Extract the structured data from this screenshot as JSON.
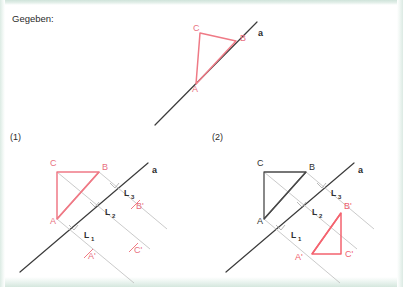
{
  "page": {
    "heading": "Gegeben:",
    "background_color": "#ffffff",
    "edge_color": "#d5e7de",
    "red_accent": "#ef7a86",
    "black_accent": "#3b3b3b",
    "helper_color": "#bdbdbd"
  },
  "given": {
    "axis_label": "a",
    "vertices": [
      {
        "name": "C",
        "x": 200,
        "y": 33
      },
      {
        "name": "B",
        "x": 236,
        "y": 41
      },
      {
        "name": "A",
        "x": 196,
        "y": 84
      }
    ],
    "vertex_labels": [
      {
        "text": "C",
        "x": 193,
        "y": 31
      },
      {
        "text": "B",
        "x": 240,
        "y": 41
      },
      {
        "text": "A",
        "x": 192,
        "y": 92
      }
    ],
    "axis_label_pos": {
      "x": 258,
      "y": 36
    }
  },
  "steps": [
    {
      "id": "step-1",
      "label": "(1)",
      "label_pos": {
        "x": 10,
        "y": 140
      },
      "axis_label": "a",
      "axis_label_pos": {
        "x": 152,
        "y": 173
      },
      "triangle_color": "#ef7a86",
      "vertex_labels": [
        {
          "text": "C",
          "x": 50,
          "y": 166
        },
        {
          "text": "B",
          "x": 102,
          "y": 170
        },
        {
          "text": "A",
          "x": 50,
          "y": 224
        }
      ],
      "image_labels": [
        {
          "text": "A'",
          "x": 86,
          "y": 257
        },
        {
          "text": "B'",
          "x": 135,
          "y": 208
        },
        {
          "text": "C'",
          "x": 133,
          "y": 252
        }
      ],
      "perpendicular_labels": [
        {
          "text": "L",
          "sub": "1",
          "x": 84,
          "y": 238
        },
        {
          "text": "L",
          "sub": "2",
          "x": 105,
          "y": 215
        },
        {
          "text": "L",
          "sub": "3",
          "x": 124,
          "y": 196
        }
      ]
    },
    {
      "id": "step-2",
      "label": "(2)",
      "label_pos": {
        "x": 212,
        "y": 140
      },
      "axis_label": "a",
      "axis_label_pos": {
        "x": 358,
        "y": 173
      },
      "triangle_color": "#4a4a4a",
      "image_triangle_color": "#f4636f",
      "vertex_labels": [
        {
          "text": "C",
          "x": 257,
          "y": 166
        },
        {
          "text": "B",
          "x": 309,
          "y": 170
        },
        {
          "text": "A",
          "x": 257,
          "y": 224
        }
      ],
      "image_labels": [
        {
          "text": "A'",
          "x": 293,
          "y": 258
        },
        {
          "text": "B'",
          "x": 345,
          "y": 206
        },
        {
          "text": "C'",
          "x": 343,
          "y": 248
        }
      ],
      "perpendicular_labels": [
        {
          "text": "L",
          "sub": "1",
          "x": 291,
          "y": 238
        },
        {
          "text": "L",
          "sub": "2",
          "x": 312,
          "y": 215
        },
        {
          "text": "L",
          "sub": "3",
          "x": 331,
          "y": 196
        }
      ]
    }
  ]
}
